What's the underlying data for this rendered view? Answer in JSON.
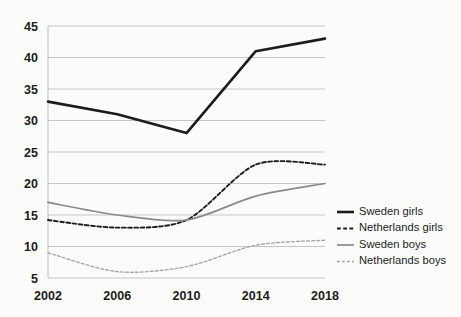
{
  "chart_data": {
    "type": "line",
    "title": "",
    "xlabel": "",
    "ylabel": "",
    "x": [
      2002,
      2006,
      2010,
      2014,
      2018
    ],
    "categories": [
      "2002",
      "2006",
      "2010",
      "2014",
      "2018"
    ],
    "xtick_labels": [
      "2002",
      "2006",
      "2010",
      "2014",
      "2018"
    ],
    "ytick_labels": [
      "5",
      "10",
      "15",
      "20",
      "25",
      "30",
      "35",
      "40",
      "45"
    ],
    "ytick_values": [
      5,
      10,
      15,
      20,
      25,
      30,
      35,
      40,
      45
    ],
    "ylim": [
      5,
      45
    ],
    "xlim": [
      2002,
      2018
    ],
    "grid": "horizontal",
    "legend_position": "right",
    "series": [
      {
        "name": "Sweden girls",
        "values": [
          33,
          31,
          28,
          41,
          43
        ],
        "color": "#1c1c1c",
        "style": "solid",
        "width": 2.6
      },
      {
        "name": "Netherlands girls",
        "values": [
          14.2,
          13,
          14.2,
          23,
          23
        ],
        "color": "#1c1c1c",
        "style": "dashed",
        "width": 1.9
      },
      {
        "name": "Sweden boys",
        "values": [
          17,
          15,
          14.2,
          18,
          20
        ],
        "color": "#8a8a8a",
        "style": "solid",
        "width": 1.7
      },
      {
        "name": "Netherlands boys",
        "values": [
          9,
          6,
          6.8,
          10.2,
          11
        ],
        "color": "#a3a3a3",
        "style": "dotted",
        "width": 1.3
      }
    ]
  },
  "legend": {
    "items": [
      {
        "label": "Sweden girls"
      },
      {
        "label": "Netherlands girls"
      },
      {
        "label": "Sweden boys"
      },
      {
        "label": "Netherlands boys"
      }
    ]
  }
}
